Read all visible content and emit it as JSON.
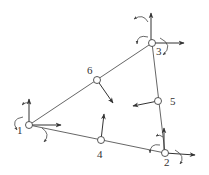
{
  "diagram": {
    "type": "triangular finite element with nodal degrees of freedom",
    "nodes": [
      {
        "id": "1",
        "label": "1",
        "x": 29,
        "y": 125,
        "role": "corner",
        "dofs": [
          "translation-x",
          "translation-y",
          "rotation-x",
          "rotation-y"
        ]
      },
      {
        "id": "2",
        "label": "2",
        "x": 165,
        "y": 153,
        "role": "corner",
        "dofs": [
          "translation-x",
          "translation-y",
          "rotation-x",
          "rotation-y"
        ]
      },
      {
        "id": "3",
        "label": "3",
        "x": 152,
        "y": 43,
        "role": "corner",
        "dofs": [
          "translation-x",
          "translation-y",
          "rotation-x",
          "rotation-y"
        ]
      },
      {
        "id": "4",
        "label": "4",
        "x": 101,
        "y": 140,
        "role": "midside",
        "dofs": [
          "normal-translation"
        ]
      },
      {
        "id": "5",
        "label": "5",
        "x": 158,
        "y": 101,
        "role": "midside",
        "dofs": [
          "normal-translation"
        ]
      },
      {
        "id": "6",
        "label": "6",
        "x": 97,
        "y": 80,
        "role": "midside",
        "dofs": [
          "normal-translation"
        ]
      }
    ],
    "edges": [
      {
        "from": "1",
        "to": "2",
        "via": "4"
      },
      {
        "from": "2",
        "to": "3",
        "via": "5"
      },
      {
        "from": "3",
        "to": "1",
        "via": "6"
      }
    ],
    "colors": {
      "line": "#555555",
      "arrow": "#333333",
      "background": "#ffffff"
    }
  }
}
